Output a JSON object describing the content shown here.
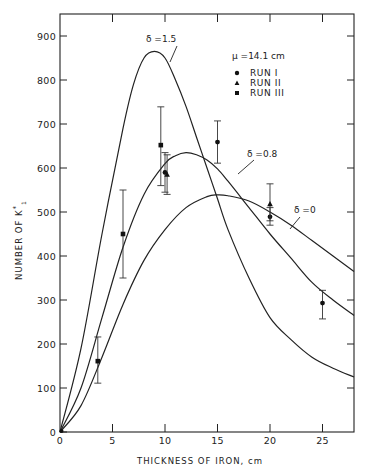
{
  "chart_data": {
    "type": "line",
    "title": "",
    "xlabel": "THICKNESS OF IRON, cm",
    "ylabel": "NUMBER OF K*1",
    "xlim": [
      0,
      28
    ],
    "ylim": [
      0,
      950
    ],
    "x_ticks": [
      0,
      5,
      10,
      15,
      20,
      25
    ],
    "x_tick_labels": [
      "0",
      "5",
      "10",
      "15",
      "20",
      "25"
    ],
    "y_ticks": [
      0,
      100,
      200,
      300,
      400,
      500,
      600,
      700,
      800,
      900
    ],
    "y_tick_labels": [
      "0",
      "100",
      "200",
      "300",
      "400",
      "500",
      "600",
      "700",
      "800",
      "900"
    ],
    "grid": false,
    "annotations": {
      "mu": "μ =14.1 cm",
      "delta_15": "δ =1.5",
      "delta_08": "δ =0.8",
      "delta_0": "δ =0"
    },
    "legend": {
      "position": "upper right",
      "entries": [
        {
          "marker": "circle",
          "label": "RUN  I"
        },
        {
          "marker": "triangle",
          "label": "RUN  II"
        },
        {
          "marker": "square",
          "label": "RUN  III"
        }
      ]
    },
    "series": [
      {
        "name": "δ =1.5",
        "kind": "curve",
        "x": [
          0,
          2,
          4,
          6,
          7,
          8,
          9,
          10,
          11,
          12,
          13,
          14,
          15,
          16,
          18,
          20,
          22,
          24,
          26,
          28
        ],
        "y": [
          0,
          190,
          450,
          690,
          790,
          850,
          865,
          850,
          800,
          740,
          670,
          600,
          530,
          460,
          350,
          260,
          210,
          170,
          145,
          125
        ]
      },
      {
        "name": "δ =0.8",
        "kind": "curve",
        "x": [
          0,
          2,
          4,
          6,
          8,
          10,
          11,
          12,
          13,
          14,
          15,
          16,
          18,
          20,
          22,
          24,
          26,
          28
        ],
        "y": [
          0,
          100,
          260,
          420,
          540,
          610,
          628,
          635,
          630,
          618,
          598,
          570,
          510,
          450,
          395,
          340,
          300,
          265
        ]
      },
      {
        "name": "δ =0",
        "kind": "curve",
        "x": [
          0,
          2,
          4,
          6,
          8,
          10,
          12,
          14,
          15,
          16,
          18,
          20,
          22,
          24,
          26,
          28
        ],
        "y": [
          0,
          60,
          170,
          290,
          390,
          460,
          510,
          535,
          539,
          537,
          525,
          500,
          470,
          435,
          400,
          365
        ]
      },
      {
        "name": "RUN I",
        "marker": "circle",
        "points": [
          {
            "x": 10.0,
            "y": 590,
            "err_low": 545,
            "err_high": 635
          },
          {
            "x": 15.0,
            "y": 659,
            "err_low": 611,
            "err_high": 707
          },
          {
            "x": 20.0,
            "y": 489,
            "err_low": 470,
            "err_high": 510
          },
          {
            "x": 25.0,
            "y": 293,
            "err_low": 257,
            "err_high": 322
          }
        ]
      },
      {
        "name": "RUN II",
        "marker": "triangle",
        "points": [
          {
            "x": 10.2,
            "y": 585,
            "err_low": 540,
            "err_high": 630
          },
          {
            "x": 20.0,
            "y": 518,
            "err_low": 480,
            "err_high": 564
          }
        ]
      },
      {
        "name": "RUN III",
        "marker": "square",
        "points": [
          {
            "x": 3.6,
            "y": 161,
            "err_low": 111,
            "err_high": 216
          },
          {
            "x": 6.0,
            "y": 450,
            "err_low": 350,
            "err_high": 550
          },
          {
            "x": 9.6,
            "y": 652,
            "err_low": 560,
            "err_high": 739
          }
        ]
      }
    ]
  }
}
